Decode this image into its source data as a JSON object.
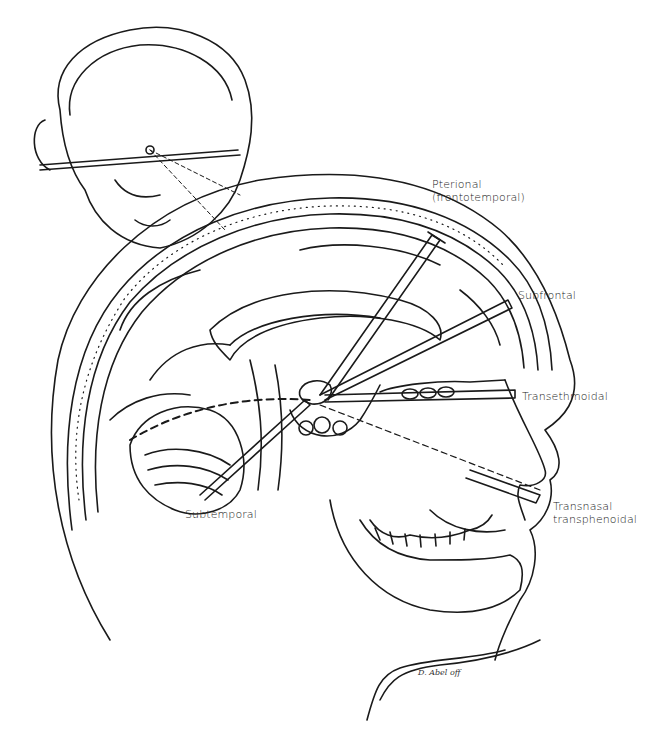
{
  "figure": {
    "labels": {
      "pterional_line1": "Pterional",
      "pterional_line2": "(frontotemporal)",
      "subfrontal": "Subfrontal",
      "transethmoidal": "Transethmoidal",
      "transnasal_line1": "Transnasal",
      "transnasal_line2": "transphenoidal",
      "subtemporal": "Subtemporal"
    },
    "signature": "D. Abel off",
    "colors": {
      "line": "#1a1a1a",
      "background": "#ffffff"
    }
  }
}
